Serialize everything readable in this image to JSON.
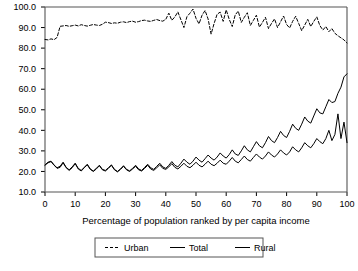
{
  "chart_data": {
    "type": "line",
    "title": "",
    "xlabel": "Percentage of population ranked by per capita income",
    "ylabel": "",
    "xlim": [
      0,
      100
    ],
    "ylim": [
      10,
      100
    ],
    "grid": false,
    "legend_position": "bottom",
    "xticks": [
      "0",
      "10",
      "20",
      "30",
      "40",
      "50",
      "60",
      "70",
      "80",
      "90",
      "100"
    ],
    "xtick_values": [
      0,
      10,
      20,
      30,
      40,
      50,
      60,
      70,
      80,
      90,
      100
    ],
    "yticks": [
      "10.0",
      "20.0",
      "30.0",
      "40.0",
      "50.0",
      "60.0",
      "70.0",
      "80.0",
      "90.0",
      "100.0"
    ],
    "ytick_values": [
      10,
      20,
      30,
      40,
      50,
      60,
      70,
      80,
      90,
      100
    ],
    "x": [
      0,
      1,
      2,
      3,
      4,
      5,
      6,
      7,
      8,
      9,
      10,
      11,
      12,
      13,
      14,
      15,
      16,
      17,
      18,
      19,
      20,
      21,
      22,
      23,
      24,
      25,
      26,
      27,
      28,
      29,
      30,
      31,
      32,
      33,
      34,
      35,
      36,
      37,
      38,
      39,
      40,
      41,
      42,
      43,
      44,
      45,
      46,
      47,
      48,
      49,
      50,
      51,
      52,
      53,
      54,
      55,
      56,
      57,
      58,
      59,
      60,
      61,
      62,
      63,
      64,
      65,
      66,
      67,
      68,
      69,
      70,
      71,
      72,
      73,
      74,
      75,
      76,
      77,
      78,
      79,
      80,
      81,
      82,
      83,
      84,
      85,
      86,
      87,
      88,
      89,
      90,
      91,
      92,
      93,
      94,
      95,
      96,
      97,
      98,
      99,
      100
    ],
    "series": [
      {
        "name": "Urban",
        "style": "dashed",
        "color": "#000000",
        "values": [
          84.2,
          84.0,
          84.5,
          84.1,
          85.2,
          90.6,
          90.8,
          91.0,
          90.6,
          90.9,
          91.2,
          90.8,
          91.4,
          91.0,
          90.7,
          91.1,
          91.5,
          91.2,
          91.0,
          91.6,
          92.6,
          92.4,
          92.0,
          92.3,
          92.1,
          92.6,
          92.8,
          92.4,
          92.9,
          93.1,
          92.6,
          92.9,
          93.4,
          93.6,
          93.2,
          93.0,
          93.5,
          93.9,
          93.4,
          93.1,
          94.0,
          97.0,
          93.5,
          95.2,
          97.6,
          93.8,
          90.0,
          95.3,
          97.0,
          99.0,
          94.5,
          91.8,
          96.0,
          98.3,
          94.2,
          86.8,
          92.0,
          96.5,
          97.5,
          93.0,
          98.6,
          94.0,
          90.5,
          96.2,
          98.0,
          92.5,
          95.0,
          97.2,
          91.0,
          93.5,
          96.0,
          90.2,
          92.5,
          95.0,
          89.5,
          92.0,
          94.2,
          90.0,
          92.8,
          95.6,
          91.5,
          89.8,
          93.0,
          95.5,
          92.0,
          88.5,
          91.2,
          94.0,
          90.5,
          93.0,
          95.2,
          91.0,
          88.8,
          90.5,
          88.0,
          89.5,
          87.2,
          86.0,
          85.0,
          84.0,
          82.5
        ]
      },
      {
        "name": "Total",
        "style": "solid",
        "color": "#000000",
        "values": [
          23.0,
          24.2,
          24.8,
          23.0,
          21.8,
          22.5,
          24.5,
          22.0,
          20.8,
          22.2,
          24.0,
          21.5,
          20.5,
          22.0,
          23.5,
          21.2,
          20.2,
          21.5,
          23.0,
          21.0,
          20.5,
          21.8,
          23.2,
          21.0,
          20.0,
          21.2,
          22.8,
          21.0,
          20.3,
          21.5,
          23.0,
          21.2,
          20.5,
          22.0,
          23.5,
          21.8,
          21.0,
          22.5,
          24.0,
          22.2,
          21.5,
          23.0,
          24.8,
          23.0,
          22.2,
          24.0,
          26.0,
          24.5,
          23.5,
          25.0,
          27.0,
          25.5,
          24.5,
          26.2,
          28.0,
          26.5,
          25.5,
          27.0,
          29.0,
          27.5,
          26.5,
          28.2,
          30.5,
          28.5,
          27.8,
          30.0,
          32.5,
          30.5,
          29.5,
          32.0,
          34.5,
          32.5,
          31.5,
          34.0,
          37.0,
          35.0,
          34.0,
          36.5,
          39.5,
          37.5,
          36.5,
          39.5,
          43.0,
          41.0,
          40.0,
          43.0,
          46.5,
          44.5,
          43.5,
          47.0,
          50.5,
          48.5,
          48.0,
          51.5,
          55.0,
          53.5,
          54.0,
          58.0,
          61.0,
          66.0,
          67.5
        ]
      },
      {
        "name": "Rural",
        "style": "solid",
        "color": "#000000",
        "values": [
          23.2,
          24.5,
          25.0,
          23.2,
          21.5,
          22.0,
          24.2,
          21.8,
          20.5,
          21.8,
          23.8,
          21.2,
          20.2,
          21.8,
          23.2,
          21.0,
          20.0,
          21.2,
          22.8,
          20.8,
          20.2,
          21.5,
          23.0,
          20.8,
          19.8,
          21.0,
          22.5,
          20.8,
          20.0,
          21.2,
          22.5,
          20.8,
          20.2,
          21.5,
          23.0,
          21.2,
          20.5,
          21.8,
          23.2,
          21.5,
          21.0,
          22.2,
          23.8,
          22.0,
          21.2,
          22.5,
          24.0,
          22.5,
          21.8,
          23.0,
          24.5,
          23.0,
          22.2,
          23.5,
          25.0,
          23.5,
          22.8,
          24.0,
          25.5,
          24.0,
          23.5,
          25.0,
          26.8,
          25.0,
          24.2,
          25.8,
          27.5,
          25.8,
          25.0,
          26.8,
          28.5,
          27.0,
          26.0,
          27.5,
          29.5,
          28.0,
          27.0,
          28.5,
          30.5,
          29.0,
          28.0,
          29.5,
          32.0,
          30.5,
          29.5,
          31.5,
          34.0,
          32.5,
          31.5,
          33.5,
          36.0,
          34.5,
          33.5,
          36.0,
          40.0,
          35.0,
          38.0,
          48.0,
          36.0,
          44.0,
          34.0
        ]
      }
    ]
  },
  "legend": {
    "items": [
      {
        "label": "Urban",
        "style": "dashed"
      },
      {
        "label": "Total",
        "style": "solid"
      },
      {
        "label": "Rural",
        "style": "solid"
      }
    ]
  }
}
